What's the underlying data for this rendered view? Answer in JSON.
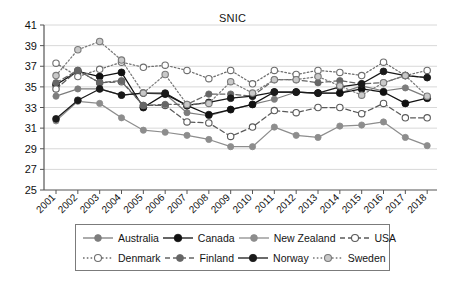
{
  "chart_data": {
    "type": "line",
    "title": "SNIC",
    "xlabel": "",
    "ylabel": "",
    "ylim": [
      25,
      41
    ],
    "ytick_step": 2,
    "yticks": [
      25,
      27,
      29,
      31,
      33,
      35,
      37,
      39,
      41
    ],
    "grid": true,
    "grid_axis": "y",
    "legend_position": "bottom",
    "categories": [
      "2001",
      "2002",
      "2003",
      "2004",
      "2005",
      "2006",
      "2007",
      "2008",
      "2009",
      "2010",
      "2011",
      "2012",
      "2013",
      "2014",
      "2015",
      "2016",
      "2017",
      "2018"
    ],
    "x": [
      2001,
      2002,
      2003,
      2004,
      2005,
      2006,
      2007,
      2008,
      2009,
      2010,
      2011,
      2012,
      2013,
      2014,
      2015,
      2016,
      2017,
      2018
    ],
    "series": [
      {
        "name": "Australia",
        "color": "#7d7d7d",
        "line_style": "solid",
        "marker": "filled-circle",
        "marker_size": 3.1,
        "values": [
          34.1,
          34.8,
          34.8,
          34.2,
          34.4,
          34.3,
          32.5,
          32.2,
          32.8,
          33.3,
          33.8,
          34.5,
          34.4,
          34.4,
          35.1,
          34.6,
          34.9,
          34.0
        ]
      },
      {
        "name": "Canada",
        "color": "#111111",
        "line_style": "solid",
        "marker": "filled-circle",
        "marker_size": 3.5,
        "values": [
          35.2,
          36.5,
          36.0,
          36.4,
          33.0,
          34.3,
          33.2,
          32.3,
          32.8,
          33.3,
          34.5,
          34.5,
          34.4,
          34.4,
          34.8,
          34.5,
          33.4,
          33.9
        ]
      },
      {
        "name": "New Zealand",
        "color": "#8d8d8d",
        "line_style": "solid",
        "marker": "filled-circle",
        "marker_size": 3.1,
        "values": [
          31.7,
          33.6,
          33.4,
          32.0,
          30.8,
          30.6,
          30.3,
          29.9,
          29.2,
          29.2,
          31.1,
          30.3,
          30.1,
          31.2,
          31.3,
          31.6,
          30.1,
          29.3
        ]
      },
      {
        "name": "USA",
        "color": "#5a5a5a",
        "line_style": "dashed",
        "marker": "open-circle",
        "marker_size": 3.2,
        "values": [
          34.8,
          36.6,
          35.4,
          35.5,
          33.2,
          33.2,
          31.6,
          31.5,
          30.2,
          31.1,
          32.7,
          32.5,
          33.0,
          33.0,
          32.4,
          33.4,
          32.0,
          32.0
        ]
      },
      {
        "name": "Denmark",
        "color": "#6e6e6e",
        "line_style": "dotted",
        "marker": "open-circle",
        "marker_size": 3.2,
        "values": [
          37.3,
          36.0,
          36.7,
          37.4,
          36.9,
          37.1,
          36.6,
          35.8,
          36.6,
          35.3,
          36.6,
          36.2,
          36.6,
          36.4,
          36.1,
          37.4,
          36.1,
          36.6
        ]
      },
      {
        "name": "Finland",
        "color": "#666666",
        "line_style": "dashed",
        "marker": "filled-circle",
        "marker_size": 3.2,
        "values": [
          35.4,
          36.6,
          35.4,
          35.6,
          33.2,
          33.3,
          33.3,
          34.3,
          34.3,
          34.1,
          35.7,
          35.7,
          35.4,
          35.6,
          35.3,
          35.4,
          36.1,
          35.9
        ]
      },
      {
        "name": "Norway",
        "color": "#1a1a1a",
        "line_style": "solid",
        "marker": "filled-circle",
        "marker_size": 3.4,
        "values": [
          31.9,
          33.7,
          34.8,
          34.2,
          34.4,
          34.4,
          33.2,
          33.5,
          33.9,
          34.1,
          34.5,
          34.5,
          34.4,
          35.0,
          35.3,
          36.5,
          36.1,
          35.9
        ]
      },
      {
        "name": "Sweden",
        "color": "#7a7a7a",
        "line_style": "dotted",
        "marker": "half-open-circle",
        "marker_size": 3.2,
        "values": [
          36.1,
          38.6,
          39.4,
          37.6,
          34.4,
          36.2,
          33.3,
          33.4,
          35.5,
          34.4,
          35.7,
          35.7,
          36.0,
          35.1,
          34.2,
          35.4,
          36.1,
          34.1
        ]
      }
    ]
  },
  "legend": {
    "rows": [
      [
        {
          "label": "Australia"
        },
        {
          "label": "Canada"
        },
        {
          "label": "New Zealand"
        },
        {
          "label": "USA"
        }
      ],
      [
        {
          "label": "Denmark"
        },
        {
          "label": "Finland"
        },
        {
          "label": "Norway"
        },
        {
          "label": "Sweden"
        }
      ]
    ]
  }
}
